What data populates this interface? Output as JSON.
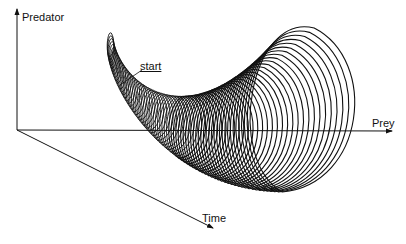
{
  "diagram": {
    "axes": {
      "vertical": "Predator",
      "horizontal": "Prey",
      "depth": "Time"
    },
    "annotations": {
      "start": "start"
    },
    "colors": {
      "ink": "#111111",
      "background": "#ffffff"
    }
  }
}
